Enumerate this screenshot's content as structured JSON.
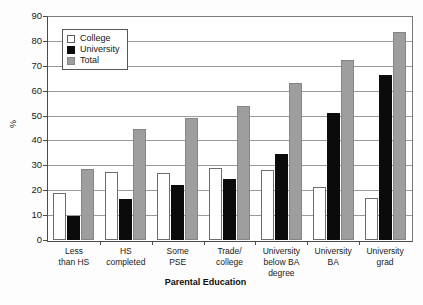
{
  "chart_data": {
    "type": "bar",
    "title": "",
    "xlabel": "Parental Education",
    "ylabel": "%",
    "ylim": [
      0,
      90
    ],
    "ytick_step": 10,
    "yticks": [
      0,
      10,
      20,
      30,
      40,
      50,
      60,
      70,
      80,
      90
    ],
    "grid": true,
    "legend_position": "upper-left-inside",
    "categories": [
      "Less\nthan HS",
      "HS\ncompleted",
      "Some\nPSE",
      "Trade/\ncollege",
      "University\nbelow BA degree",
      "University\nBA",
      "University\ngrad"
    ],
    "series": [
      {
        "name": "College",
        "color": "#ffffff",
        "values": [
          19,
          27.5,
          27,
          29,
          28,
          21.5,
          17
        ]
      },
      {
        "name": "University",
        "color": "#0b0b0b",
        "values": [
          9.5,
          16.5,
          22,
          24.5,
          34.5,
          51,
          66.5
        ]
      },
      {
        "name": "Total",
        "color": "#9e9e9e",
        "values": [
          28.5,
          44.5,
          49,
          54,
          63,
          72.5,
          83.5
        ]
      }
    ]
  },
  "axis": {
    "y_title": "%",
    "x_title": "Parental Education",
    "y_tick_labels": [
      "90",
      "80",
      "70",
      "60",
      "50",
      "40",
      "30",
      "20",
      "10",
      "0"
    ],
    "x_tick_labels": [
      [
        "Less",
        "than HS"
      ],
      [
        "HS",
        "completed"
      ],
      [
        "Some",
        "PSE"
      ],
      [
        "Trade/",
        "college"
      ],
      [
        "University",
        "below BA degree"
      ],
      [
        "University",
        "BA"
      ],
      [
        "University",
        "grad"
      ]
    ]
  },
  "legend": {
    "items": [
      {
        "label": "College",
        "swatch": "college"
      },
      {
        "label": "University",
        "swatch": "university"
      },
      {
        "label": "Total",
        "swatch": "total"
      }
    ]
  }
}
